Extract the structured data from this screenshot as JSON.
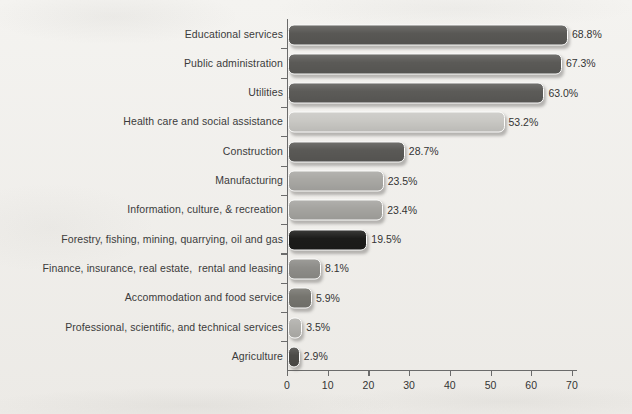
{
  "chart_data": {
    "type": "bar",
    "orientation": "horizontal",
    "title": "",
    "xlabel": "",
    "ylabel": "",
    "xlim": [
      0,
      75
    ],
    "grid": false,
    "legend": false,
    "value_suffix": "%",
    "x_ticks": [
      0,
      10,
      20,
      30,
      40,
      50,
      60,
      70
    ],
    "x_tick_labels": [
      "0",
      "10",
      "20",
      "30",
      "40",
      "50",
      "60",
      "70"
    ],
    "categories": [
      "Educational services",
      "Public administration",
      "Utilities",
      "Health care and social assistance",
      "Construction",
      "Manufacturing",
      "Information, culture, & recreation",
      "Forestry, fishing, mining, quarrying, oil and gas",
      "Finance, insurance, real estate,  rental and leasing",
      "Accommodation and food service",
      "Professional, scientific, and technical services",
      "Agriculture"
    ],
    "values": [
      68.8,
      67.3,
      63.0,
      53.2,
      28.7,
      23.5,
      23.4,
      19.5,
      8.1,
      5.9,
      3.5,
      2.9
    ],
    "value_labels": [
      "68.8%",
      "67.3%",
      "63.0%",
      "53.2%",
      "28.7%",
      "23.5%",
      "23.4%",
      "19.5%",
      "8.1%",
      "5.9%",
      "3.5%",
      "2.9%"
    ],
    "bar_colors": [
      "#595855",
      "#5b5a57",
      "#5c5b58",
      "#c9c8c4",
      "#5a5956",
      "#a9a8a4",
      "#a5a4a0",
      "#1c1c1a",
      "#8e8d89",
      "#76756f",
      "#b1b0ac",
      "#4c4b48"
    ]
  },
  "colors": {
    "background": "#f2f1ee",
    "axis": "#6b6b6b",
    "text": "#343434"
  }
}
